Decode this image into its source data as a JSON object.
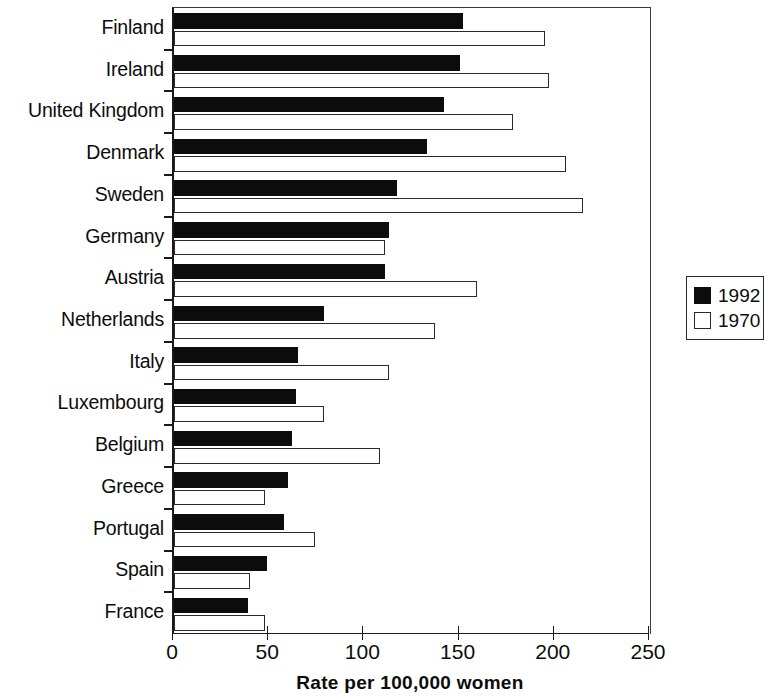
{
  "chart_data": {
    "type": "bar",
    "orientation": "horizontal",
    "title": "",
    "xlabel": "Rate per 100,000 women",
    "ylabel": "",
    "xlim": [
      0,
      250
    ],
    "xticks": [
      0,
      50,
      100,
      150,
      200,
      250
    ],
    "xticklabels": [
      "0",
      "50",
      "100",
      "150",
      "200",
      "250"
    ],
    "grid": false,
    "legend_position": "right",
    "categories": [
      "Finland",
      "Ireland",
      "United Kingdom",
      "Denmark",
      "Sweden",
      "Germany",
      "Austria",
      "Netherlands",
      "Italy",
      "Luxembourg",
      "Belgium",
      "Greece",
      "Portugal",
      "Spain",
      "France"
    ],
    "series": [
      {
        "name": "1992",
        "color": "#0c0c0c",
        "fill": "solid",
        "values": [
          152,
          150,
          142,
          133,
          117,
          113,
          111,
          79,
          65,
          64,
          62,
          60,
          58,
          49,
          39
        ]
      },
      {
        "name": "1970",
        "color": "#ffffff",
        "fill": "hollow",
        "values": [
          195,
          197,
          178,
          206,
          215,
          111,
          159,
          137,
          113,
          79,
          108,
          48,
          74,
          40,
          48
        ]
      }
    ]
  },
  "legend": {
    "entries": [
      {
        "label": "1992",
        "swatch": "filled"
      },
      {
        "label": "1970",
        "swatch": "hollow"
      }
    ]
  }
}
